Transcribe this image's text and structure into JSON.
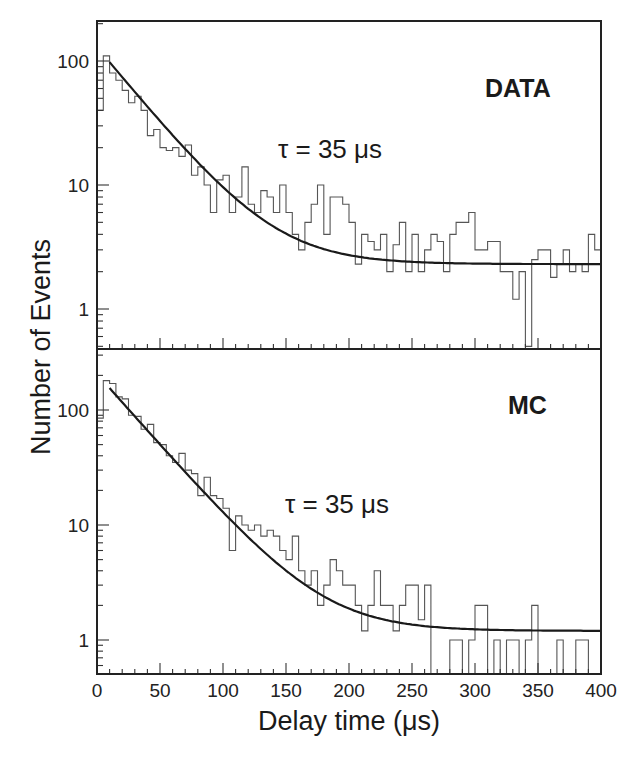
{
  "chart_data": {
    "type": "bar",
    "subtype": "step-histogram with exponential fit, log y-axis, two stacked panels sharing x-axis",
    "xlabel": "Delay time  (μs)",
    "ylabel": "Number  of  Events",
    "x_ticks": [
      0,
      50,
      100,
      150,
      200,
      250,
      300,
      350,
      400
    ],
    "x_tick_labels": [
      "0",
      "50",
      "100",
      "150",
      "200",
      "250",
      "300",
      "350",
      "400"
    ],
    "xlim": [
      0,
      400
    ],
    "bin_width": 5,
    "grid": false,
    "panels": [
      {
        "name": "DATA",
        "label": "DATA",
        "annotation": "τ = 35 μs",
        "yscale": "log",
        "ylim": [
          0.5,
          210
        ],
        "y_ticks": [
          1,
          10,
          100
        ],
        "y_tick_labels": [
          "1",
          "10",
          "100"
        ],
        "fit": {
          "tau": 35,
          "amplitude_at_x10": 98,
          "constant": 2.3,
          "x_start": 10
        },
        "histogram": {
          "x": [
            0,
            5,
            10,
            15,
            20,
            25,
            30,
            35,
            40,
            45,
            50,
            55,
            60,
            65,
            70,
            75,
            80,
            85,
            90,
            95,
            100,
            105,
            110,
            115,
            120,
            125,
            130,
            135,
            140,
            145,
            150,
            155,
            160,
            165,
            170,
            175,
            180,
            185,
            190,
            195,
            200,
            205,
            210,
            215,
            220,
            225,
            230,
            235,
            240,
            245,
            250,
            255,
            260,
            265,
            270,
            275,
            280,
            285,
            290,
            295,
            300,
            305,
            310,
            315,
            320,
            325,
            330,
            335,
            340,
            345,
            350,
            355,
            360,
            365,
            370,
            375,
            380,
            385,
            390,
            395
          ],
          "values": [
            40,
            110,
            80,
            70,
            58,
            46,
            52,
            40,
            25,
            28,
            20,
            19,
            20,
            17,
            21,
            12,
            14,
            10,
            6,
            11,
            12,
            6,
            8,
            14,
            7,
            6,
            9,
            8,
            6,
            10,
            6,
            4,
            3,
            5,
            7,
            10,
            4,
            8,
            8,
            7,
            5,
            2.3,
            4,
            3.5,
            3,
            4,
            2,
            3.3,
            5,
            2,
            4,
            2,
            3,
            4,
            3.5,
            2,
            4,
            5,
            5,
            6,
            3,
            3,
            3.5,
            3.5,
            2,
            2,
            1.2,
            2,
            0.5,
            2.5,
            3,
            3,
            1.8,
            2.3,
            3,
            2,
            2.3,
            2,
            4,
            3,
            2,
            2,
            2,
            3,
            1.5,
            3,
            2,
            2,
            2,
            3,
            2,
            1.3,
            2,
            3,
            3,
            2,
            3,
            2.5,
            2,
            2,
            1.5,
            3,
            2,
            3,
            3,
            35
          ]
        }
      },
      {
        "name": "MC",
        "label": "MC",
        "annotation": "τ = 35 μs",
        "yscale": "log",
        "ylim": [
          0.55,
          330
        ],
        "y_ticks": [
          1,
          10,
          100
        ],
        "y_tick_labels": [
          "1",
          "10",
          "100"
        ],
        "fit": {
          "tau": 35,
          "amplitude_at_x10": 155,
          "constant": 1.2,
          "x_start": 10
        },
        "histogram": {
          "x": [
            0,
            5,
            10,
            15,
            20,
            25,
            30,
            35,
            40,
            45,
            50,
            55,
            60,
            65,
            70,
            75,
            80,
            85,
            90,
            95,
            100,
            105,
            110,
            115,
            120,
            125,
            130,
            135,
            140,
            145,
            150,
            155,
            160,
            165,
            170,
            175,
            180,
            185,
            190,
            195,
            200,
            205,
            210,
            215,
            220,
            225,
            230,
            235,
            240,
            245,
            250,
            255,
            260,
            265,
            270,
            275,
            280,
            285,
            290,
            295,
            300,
            305,
            310,
            315,
            320,
            325,
            330,
            335,
            340,
            345,
            350,
            355,
            360,
            365,
            370,
            375,
            380,
            385,
            390,
            395
          ],
          "values": [
            85,
            180,
            170,
            130,
            125,
            90,
            88,
            68,
            75,
            52,
            50,
            40,
            35,
            42,
            30,
            28,
            18,
            26,
            18,
            17,
            14,
            6,
            12,
            10,
            9,
            10,
            8,
            9,
            8,
            6,
            5,
            8,
            4,
            3,
            4,
            2,
            3,
            5,
            4,
            3,
            3,
            2,
            1.2,
            2,
            4,
            2,
            2,
            1.2,
            2,
            3,
            3,
            1.5,
            3,
            0.5,
            0.5,
            0.5,
            1,
            1,
            0.5,
            1,
            2,
            2,
            0.5,
            1,
            0.5,
            1,
            1,
            0.5,
            1,
            2,
            0.5,
            0.5,
            0.5,
            1,
            0.5,
            0.5,
            1,
            1,
            0.5,
            0.5
          ]
        }
      }
    ]
  },
  "labels": {
    "y_axis_title": "Number  of  Events",
    "x_axis_title": "Delay time  (μs)",
    "top_panel_label": "DATA",
    "bottom_panel_label": "MC",
    "top_annotation": "τ = 35 μs",
    "bottom_annotation": "τ = 35 μs"
  }
}
